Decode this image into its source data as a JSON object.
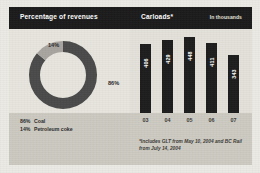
{
  "header": {
    "title_left": "Percentage of revenues",
    "title_right": "Carloads*",
    "units": "In thousands"
  },
  "colors": {
    "header_background": "#1b1b1b",
    "bar_fill": "#1d1d1d",
    "donut_major": "#4a4a4a",
    "donut_minor": "#a8a5a0",
    "panel_background": "#e7e5de",
    "footer_band": "#ccc9c1"
  },
  "donut": {
    "label_major": "86%",
    "label_minor": "14%",
    "legend": [
      {
        "pct": "86%",
        "name": "Coal"
      },
      {
        "pct": "14%",
        "name": "Petroleum coke"
      }
    ]
  },
  "footnote": {
    "line1": "*Includes GLT from May 10, 2004 and BC Rail",
    "line2": "from July 14, 2004"
  },
  "chart_data": [
    {
      "type": "pie",
      "title": "Percentage of revenues",
      "subtitle": "",
      "xlabel": "",
      "ylabel": "",
      "grid": false,
      "legend_position": "bottom-left",
      "categories": [
        "Coal",
        "Petroleum coke"
      ],
      "values": [
        86,
        14
      ],
      "value_labels": [
        "86%",
        "14%"
      ],
      "units": "percent",
      "annotations": [
        "86% Coal",
        "14% Petroleum coke"
      ]
    },
    {
      "type": "bar",
      "title": "Carloads*",
      "subtitle": "In thousands",
      "xlabel": "",
      "ylabel": "In thousands",
      "grid": false,
      "legend_position": "none",
      "categories": [
        "03",
        "04",
        "05",
        "06",
        "07"
      ],
      "values": [
        406,
        429,
        448,
        411,
        343
      ],
      "ylim": [
        0,
        448
      ],
      "units": "thousands of carloads",
      "annotations": [
        "*Includes GLT from May 10, 2004 and BC Rail from July 14, 2004"
      ]
    }
  ]
}
